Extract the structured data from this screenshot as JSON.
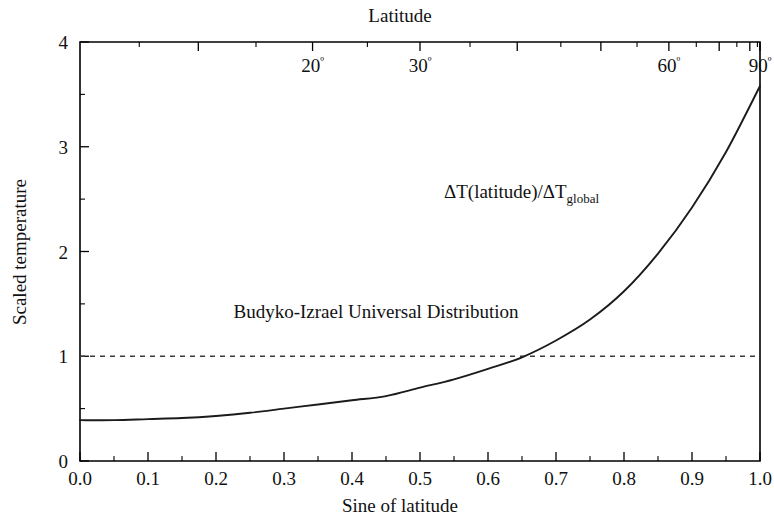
{
  "figure": {
    "top_title": "Latitude",
    "x_axis_title": "Sine of latitude",
    "y_axis_title": "Scaled temperature"
  },
  "annotations": {
    "curve_label_prefix": "ΔT(latitude)/ΔT",
    "curve_label_sub": "global",
    "distribution_label": "Budyko-Izrael Universal Distribution"
  },
  "chart_data": {
    "type": "line",
    "title": "Latitude",
    "xlabel": "Sine of latitude",
    "ylabel": "Scaled temperature",
    "xlim": [
      0.0,
      1.0
    ],
    "ylim": [
      0,
      4
    ],
    "grid": false,
    "legend": "none",
    "x_ticks": [
      "0.0",
      "0.1",
      "0.2",
      "0.3",
      "0.4",
      "0.5",
      "0.6",
      "0.7",
      "0.8",
      "0.9",
      "1.0"
    ],
    "x_tick_values": [
      0.0,
      0.1,
      0.2,
      0.3,
      0.4,
      0.5,
      0.6,
      0.7,
      0.8,
      0.9,
      1.0
    ],
    "y_ticks": [
      "0",
      "1",
      "2",
      "3",
      "4"
    ],
    "y_tick_values": [
      0,
      1,
      2,
      3,
      4
    ],
    "y_minor_tick_values": [
      0.5,
      1.5,
      2.5,
      3.5
    ],
    "top_axis": {
      "label": "Latitude",
      "tick_labels": [
        "20º",
        "30º",
        "60º",
        "90º"
      ],
      "labeled_degrees": [
        20,
        30,
        60,
        90
      ],
      "tick_degrees": [
        10,
        20,
        30,
        40,
        50,
        60,
        70,
        80,
        90
      ],
      "tick_positions_sine": [
        0.174,
        0.342,
        0.5,
        0.643,
        0.766,
        0.866,
        0.94,
        0.985,
        1.0
      ]
    },
    "series": [
      {
        "name": "ΔT(latitude)/ΔT_global",
        "x": [
          0.0,
          0.05,
          0.1,
          0.15,
          0.2,
          0.25,
          0.3,
          0.35,
          0.4,
          0.45,
          0.5,
          0.55,
          0.6,
          0.65,
          0.7,
          0.75,
          0.8,
          0.85,
          0.9,
          0.95,
          1.0
        ],
        "values": [
          0.39,
          0.39,
          0.4,
          0.41,
          0.43,
          0.46,
          0.5,
          0.54,
          0.58,
          0.62,
          0.7,
          0.78,
          0.88,
          0.99,
          1.15,
          1.35,
          1.62,
          1.98,
          2.42,
          2.95,
          3.58
        ]
      },
      {
        "name": "reference-line",
        "style": "dashed",
        "x": [
          0.0,
          1.0
        ],
        "values": [
          1.0,
          1.0
        ]
      }
    ],
    "annotations": [
      {
        "text": "ΔT(latitude)/ΔT_global",
        "x": 0.62,
        "y": 1.84
      },
      {
        "text": "Budyko-Izrael Universal Distribution",
        "x": 0.42,
        "y": 1.23
      }
    ]
  }
}
